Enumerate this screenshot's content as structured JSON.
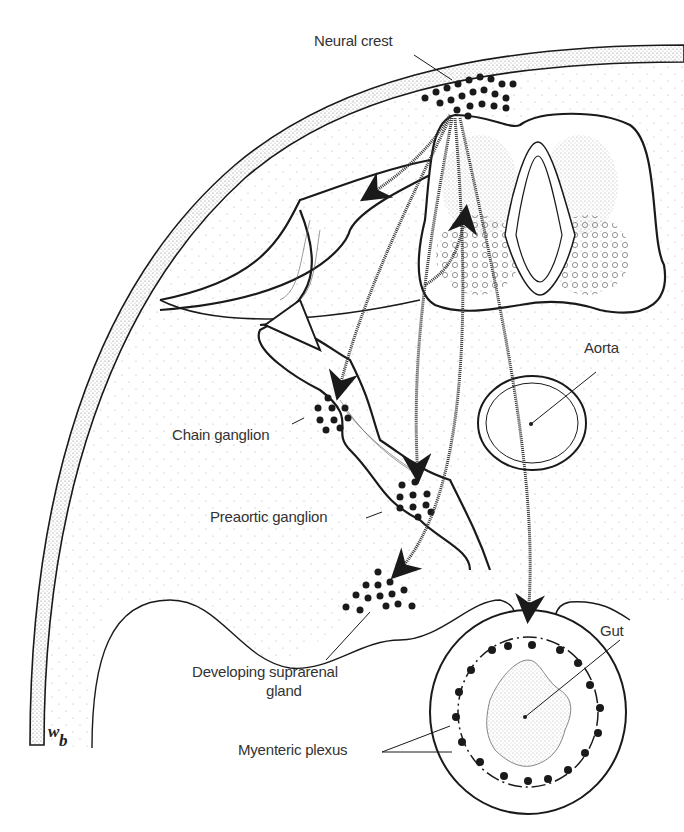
{
  "diagram": {
    "labels": {
      "neural_crest": "Neural crest",
      "aorta": "Aorta",
      "chain_ganglion": "Chain ganglion",
      "preaortic_ganglion": "Preaortic ganglion",
      "suprarenal_line1": "Developing suprarenal",
      "suprarenal_line2": "gland",
      "gut": "Gut",
      "myenteric_plexus": "Myenteric plexus",
      "body_wall_w": "w",
      "body_wall_b": "b"
    },
    "colors": {
      "ink": "#1a1a1a",
      "stipple": "#9a9a9a",
      "background": "#ffffff"
    }
  }
}
